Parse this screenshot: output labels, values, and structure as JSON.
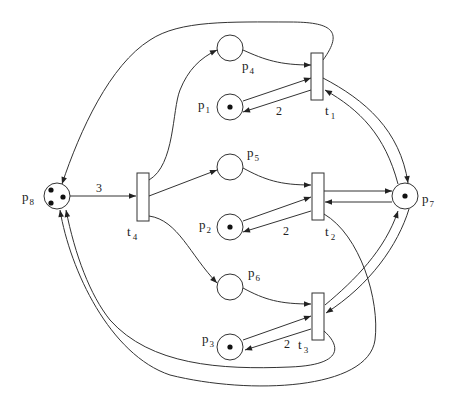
{
  "diagram": {
    "type": "petri-net",
    "colors": {
      "stroke": "#333333",
      "token": "#111111",
      "background": "#ffffff"
    },
    "places": [
      {
        "id": "p1",
        "label": "p",
        "sub": "1",
        "tokens": 1
      },
      {
        "id": "p2",
        "label": "p",
        "sub": "2",
        "tokens": 1
      },
      {
        "id": "p3",
        "label": "p",
        "sub": "3",
        "tokens": 1
      },
      {
        "id": "p4",
        "label": "p",
        "sub": "4",
        "tokens": 0
      },
      {
        "id": "p5",
        "label": "p",
        "sub": "5",
        "tokens": 0
      },
      {
        "id": "p6",
        "label": "p",
        "sub": "6",
        "tokens": 0
      },
      {
        "id": "p7",
        "label": "p",
        "sub": "7",
        "tokens": 1
      },
      {
        "id": "p8",
        "label": "p",
        "sub": "8",
        "tokens": 3
      }
    ],
    "transitions": [
      {
        "id": "t1",
        "label": "t",
        "sub": "1"
      },
      {
        "id": "t2",
        "label": "t",
        "sub": "2"
      },
      {
        "id": "t3",
        "label": "t",
        "sub": "3"
      },
      {
        "id": "t4",
        "label": "t",
        "sub": "4"
      }
    ],
    "arc_weights": {
      "p8_t4": "3",
      "t1_p1": "2",
      "t2_p2": "2",
      "t3_p3": "2"
    },
    "arcs": [
      {
        "from": "p8",
        "to": "t4",
        "weight": "3"
      },
      {
        "from": "t4",
        "to": "p4"
      },
      {
        "from": "t4",
        "to": "p5"
      },
      {
        "from": "t4",
        "to": "p6"
      },
      {
        "from": "p4",
        "to": "t1"
      },
      {
        "from": "p1",
        "to": "t1"
      },
      {
        "from": "t1",
        "to": "p1",
        "weight": "2"
      },
      {
        "from": "t1",
        "to": "p7"
      },
      {
        "from": "p7",
        "to": "t1"
      },
      {
        "from": "t1",
        "to": "p8"
      },
      {
        "from": "p5",
        "to": "t2"
      },
      {
        "from": "p2",
        "to": "t2"
      },
      {
        "from": "t2",
        "to": "p2",
        "weight": "2"
      },
      {
        "from": "t2",
        "to": "p7"
      },
      {
        "from": "p7",
        "to": "t2"
      },
      {
        "from": "t2",
        "to": "p8"
      },
      {
        "from": "p6",
        "to": "t3"
      },
      {
        "from": "p3",
        "to": "t3"
      },
      {
        "from": "t3",
        "to": "p3",
        "weight": "2"
      },
      {
        "from": "t3",
        "to": "p7"
      },
      {
        "from": "p7",
        "to": "t3"
      },
      {
        "from": "t3",
        "to": "p8"
      }
    ]
  }
}
